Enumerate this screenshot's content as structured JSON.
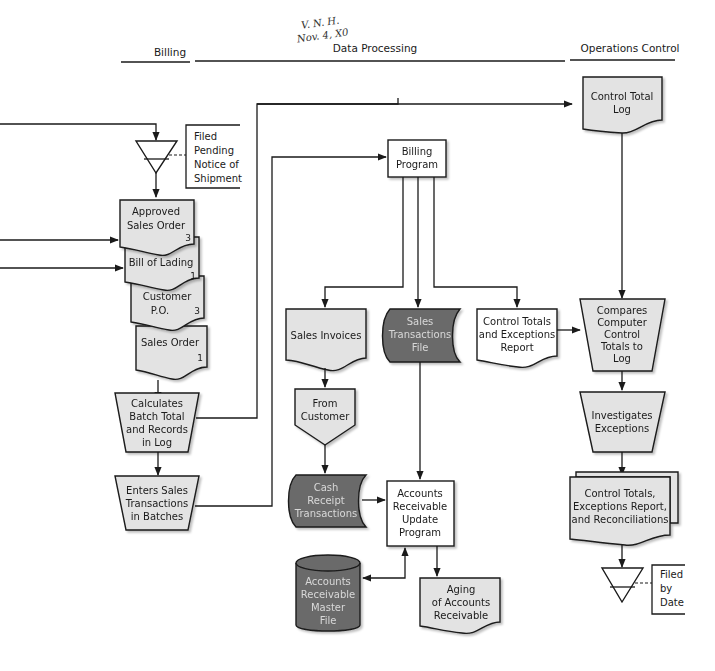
{
  "columns": {
    "billing": "Billing",
    "data_processing": "Data Processing",
    "operations_control": "Operations Control"
  },
  "annotation": {
    "line1": "V. N. H.",
    "line2": "Nov. 4, X0"
  },
  "billing": {
    "file_pending_label": [
      "Filed",
      "Pending",
      "Notice of",
      "Shipment"
    ],
    "approved_sales_order": {
      "lines": [
        "Approved",
        "Sales Order"
      ],
      "copy": "3"
    },
    "bill_of_lading": {
      "lines": [
        "Bill of Lading"
      ],
      "copy": "1"
    },
    "customer_po": {
      "lines": [
        "Customer",
        "P.O."
      ],
      "copy": "3"
    },
    "sales_order": {
      "lines": [
        "Sales Order"
      ],
      "copy": "1"
    },
    "calculates_batch": [
      "Calculates",
      "Batch Total",
      "and Records",
      "in Log"
    ],
    "enters_sales": [
      "Enters Sales",
      "Transactions",
      "in Batches"
    ]
  },
  "data_processing": {
    "billing_program": [
      "Billing",
      "Program"
    ],
    "sales_invoices": [
      "Sales Invoices"
    ],
    "sales_transactions_file": [
      "Sales",
      "Transactions",
      "File"
    ],
    "control_totals_report": [
      "Control Totals",
      "and Exceptions",
      "Report"
    ],
    "from_customer": [
      "From",
      "Customer"
    ],
    "cash_receipt": [
      "Cash",
      "Receipt",
      "Transactions"
    ],
    "ar_update_program": [
      "Accounts",
      "Receivable",
      "Update",
      "Program"
    ],
    "ar_master_file": [
      "Accounts",
      "Receivable",
      "Master",
      "File"
    ],
    "aging_report": [
      "Aging",
      "of Accounts",
      "Receivable"
    ]
  },
  "operations_control": {
    "control_total_log": [
      "Control Total",
      "Log"
    ],
    "compares": [
      "Compares",
      "Computer",
      "Control",
      "Totals to",
      "Log"
    ],
    "investigates": [
      "Investigates",
      "Exceptions"
    ],
    "reconciliations": [
      "Control Totals,",
      "Exceptions Report,",
      "and Reconciliations"
    ],
    "filed_by_date": [
      "Filed",
      "by",
      "Date"
    ]
  },
  "colors": {
    "light_fill": "#e3e3e3",
    "dark_fill": "#6b6b6b",
    "stroke": "#1a1a1a",
    "background": "#ffffff"
  }
}
